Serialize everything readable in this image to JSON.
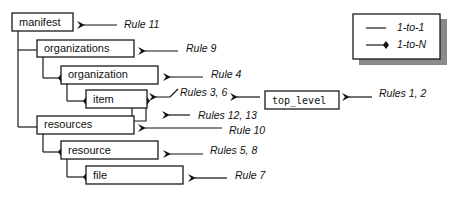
{
  "diagram": {
    "nodes": {
      "manifest": "manifest",
      "organizations": "organizations",
      "organization": "organization",
      "item": "item",
      "resources": "resources",
      "resource": "resource",
      "file": "file",
      "top_level": "top_level"
    },
    "rules": {
      "manifest": "Rule 11",
      "organizations": "Rule 9",
      "organization": "Rule 4",
      "item": "Rules 3, 6",
      "item_recursion": "Rules 12, 13",
      "resources": "Rule 10",
      "resource": "Rules 5, 8",
      "file": "Rule 7",
      "top_level": "Rules 1, 2"
    },
    "legend": {
      "one_to_one": "1-to-1",
      "one_to_n": "1-to-N"
    }
  }
}
